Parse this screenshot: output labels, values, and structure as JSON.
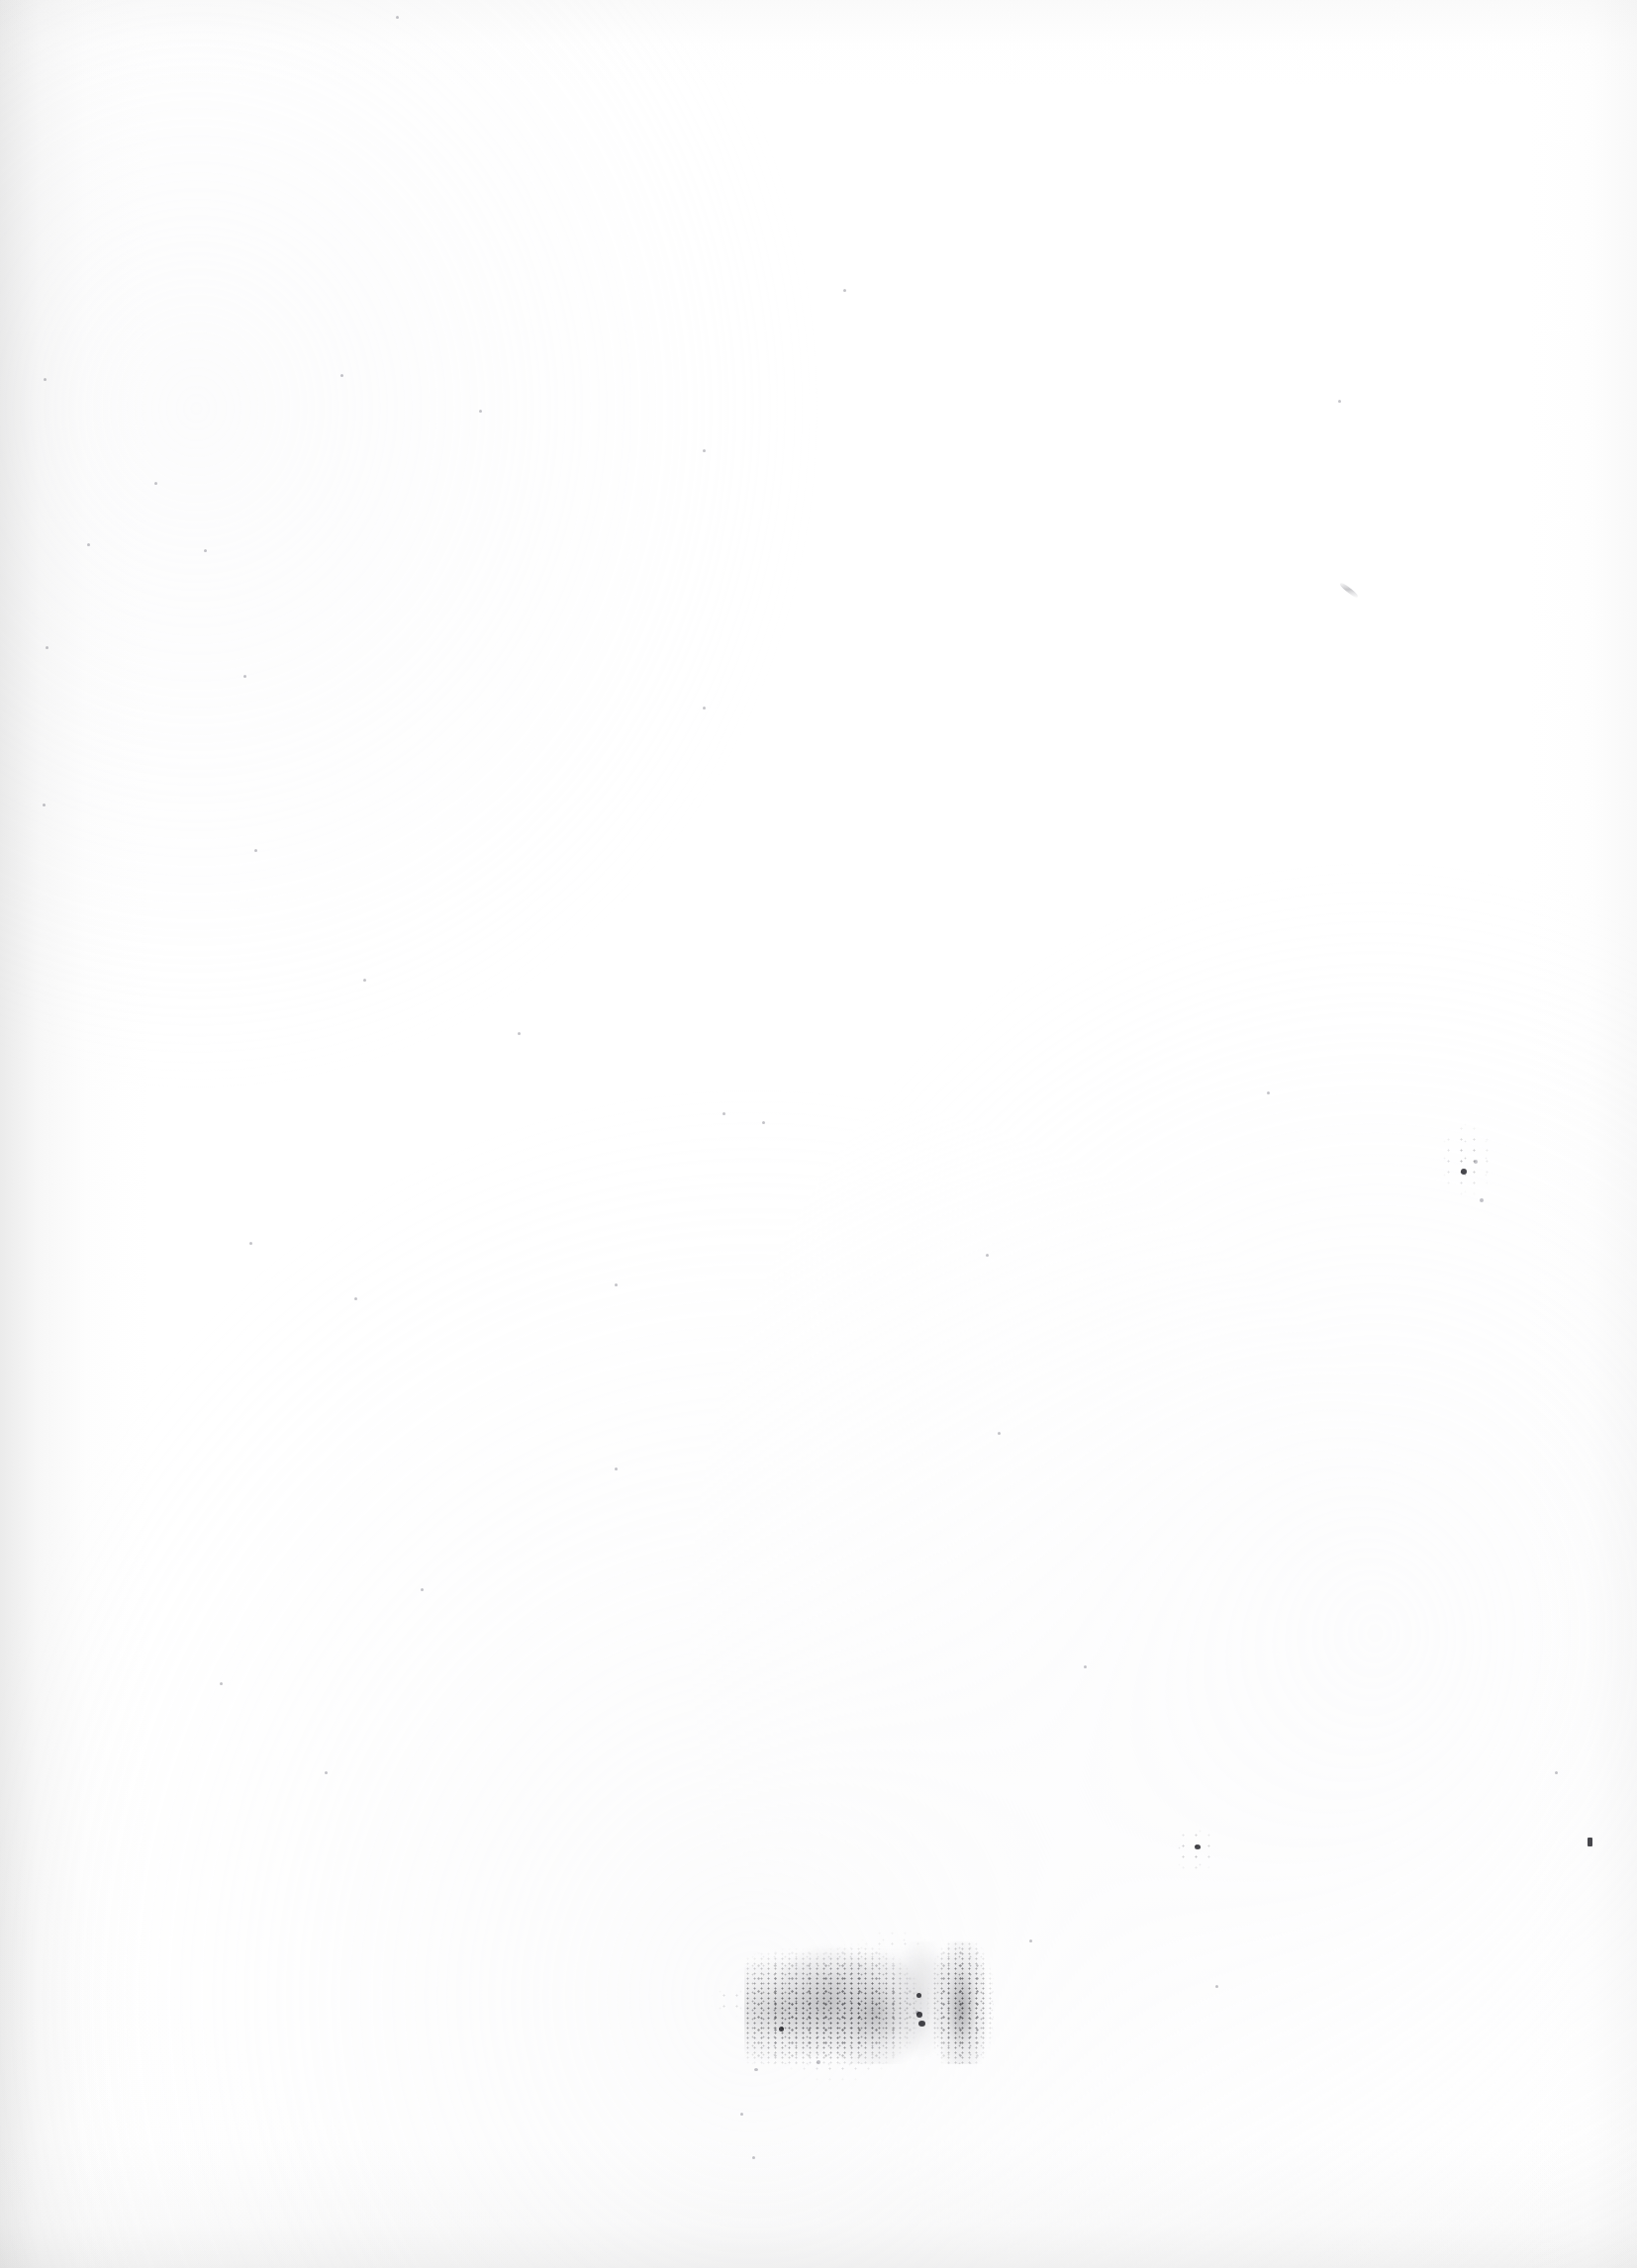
{
  "document": {
    "kind": "scanned-page",
    "condition": "blank",
    "description": "Blank scanned document page with no printed text or graphics",
    "page_width_px": 1654,
    "page_height_px": 2292,
    "background_color": "#ffffff",
    "paper_tone_color": "#fdfdfd",
    "edge_shadow_color": "#bdbdbd",
    "ink_artifact_color": "#3a3a40"
  },
  "artifacts": {
    "summary": "No legible characters are present. All visible marks are scanning artifacts: a faint bleed-through smudge band near the foot of the page, small speck clusters, isolated dust dots and a hair fiber.",
    "items": [
      {
        "name": "bleed-through-smudge",
        "type": "smudge",
        "legible_text": "",
        "x": 762,
        "y": 1972,
        "width": 232,
        "height": 104
      },
      {
        "name": "speck-cluster-lower-right",
        "type": "speck-cluster",
        "x": 1176,
        "y": 1838,
        "width": 62,
        "height": 62
      },
      {
        "name": "speck-cluster-mid-right",
        "type": "speck-cluster",
        "x": 1444,
        "y": 1124,
        "width": 74,
        "height": 96
      },
      {
        "name": "dust-dot-right-edge",
        "type": "dust-dot",
        "x": 1604,
        "y": 1860,
        "width": 5,
        "height": 8
      },
      {
        "name": "hair-fiber-upper-right",
        "type": "fiber",
        "x": 1352,
        "y": 592,
        "width": 20,
        "height": 14
      }
    ]
  },
  "edges": {
    "left_vignette": true,
    "bottom_vignette": true,
    "right_vignette": true,
    "top_vignette": true
  }
}
